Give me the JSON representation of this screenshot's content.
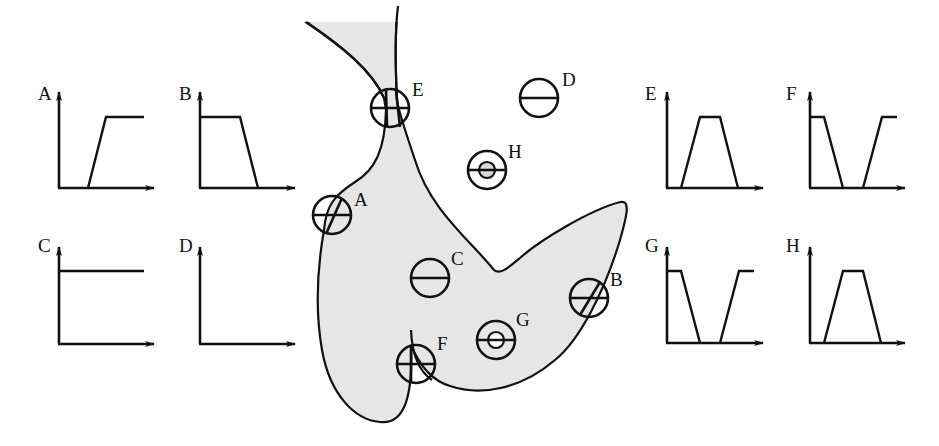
{
  "figure": {
    "colors": {
      "region_fill": "#e6e6e6",
      "stroke": "#111111",
      "background": "#ffffff"
    }
  },
  "left_plots": [
    {
      "id": "A",
      "label": "A",
      "shape": "ramp-up"
    },
    {
      "id": "B",
      "label": "B",
      "shape": "ramp-down"
    },
    {
      "id": "C",
      "label": "C",
      "shape": "constant-high"
    },
    {
      "id": "D",
      "label": "D",
      "shape": "zero"
    }
  ],
  "right_plots": [
    {
      "id": "E",
      "label": "E",
      "shape": "trapezoid-pulse"
    },
    {
      "id": "F",
      "label": "F",
      "shape": "notch"
    },
    {
      "id": "G",
      "label": "G",
      "shape": "notch"
    },
    {
      "id": "H",
      "label": "H",
      "shape": "trapezoid-pulse"
    }
  ],
  "probes": [
    {
      "id": "A",
      "label": "A",
      "type": "crossed-circle",
      "location": "on boundary"
    },
    {
      "id": "B",
      "label": "B",
      "type": "crossed-circle",
      "location": "on boundary"
    },
    {
      "id": "C",
      "label": "C",
      "type": "bar-circle",
      "location": "inside region"
    },
    {
      "id": "D",
      "label": "D",
      "type": "bar-circle",
      "location": "outside region"
    },
    {
      "id": "E",
      "label": "E",
      "type": "crossed-circle",
      "location": "narrow neck"
    },
    {
      "id": "F",
      "label": "F",
      "type": "crossed-circle",
      "location": "boundary corner"
    },
    {
      "id": "G",
      "label": "G",
      "type": "ring-circle",
      "location": "inside region"
    },
    {
      "id": "H",
      "label": "H",
      "type": "ring-circle",
      "location": "outside region"
    }
  ]
}
